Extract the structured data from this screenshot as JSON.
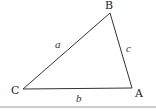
{
  "diagram": {
    "type": "triangle",
    "vertices": [
      {
        "name": "A",
        "x": 132,
        "y": 88,
        "label_x": 137,
        "label_y": 97
      },
      {
        "name": "B",
        "x": 110,
        "y": 13,
        "label_x": 105,
        "label_y": 9
      },
      {
        "name": "C",
        "x": 23,
        "y": 89,
        "label_x": 11,
        "label_y": 94
      }
    ],
    "sides": [
      {
        "name": "a",
        "from": "C",
        "to": "B",
        "label_x": 55,
        "label_y": 48
      },
      {
        "name": "b",
        "from": "C",
        "to": "A",
        "label_x": 76,
        "label_y": 102
      },
      {
        "name": "c",
        "from": "B",
        "to": "A",
        "label_x": 126,
        "label_y": 52
      }
    ],
    "baseline": {
      "y": 107,
      "color": "#9a9a9a"
    },
    "stroke_color": "#333333"
  }
}
